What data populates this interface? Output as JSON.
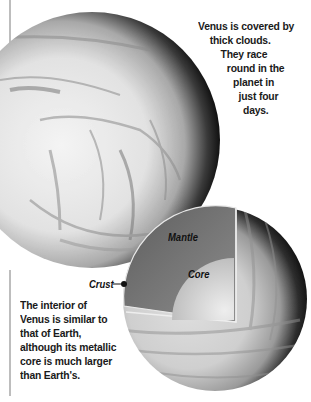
{
  "top_caption": {
    "lines": [
      "Venus is covered by",
      "thick clouds.",
      "They race",
      "round in the",
      "planet in",
      "just four",
      "days."
    ]
  },
  "bottom_caption": {
    "lines": [
      "The interior of",
      "Venus is similar to",
      "that of Earth,",
      "although its metallic",
      "core is much larger",
      "than Earth's."
    ]
  },
  "diagram_labels": {
    "mantle": "Mantle",
    "core": "Core",
    "crust": "Crust"
  },
  "colors": {
    "rule": "#bdbdbd",
    "text": "#1a1a1a",
    "mantle": "#7a7a7a",
    "core": "#d9d9d9"
  }
}
